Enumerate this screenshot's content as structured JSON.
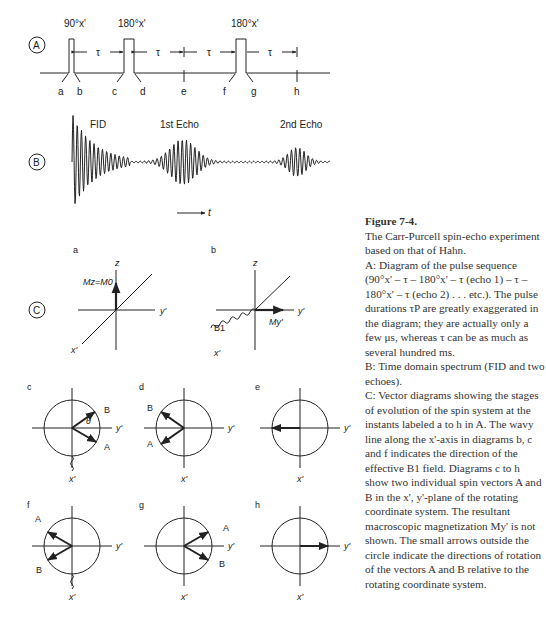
{
  "panel_labels": {
    "A": "A",
    "B": "B",
    "C": "C"
  },
  "pulse_sequence": {
    "pulses": [
      "90°x'",
      "180°x'",
      "180°x'"
    ],
    "tau_label": "τ",
    "instants": [
      "a",
      "b",
      "c",
      "d",
      "e",
      "f",
      "g",
      "h"
    ]
  },
  "signal": {
    "labels": [
      "FID",
      "1st Echo",
      "2nd Echo"
    ],
    "time_arrow_label": "t"
  },
  "vector_diagrams": {
    "a": {
      "label": "a",
      "z": "z",
      "y": "y'",
      "x": "x'",
      "vector": "Mz=M0"
    },
    "b": {
      "label": "b",
      "z": "z",
      "y": "y'",
      "x": "x'",
      "field": "B1",
      "vector": "My'"
    },
    "c": {
      "label": "c",
      "y": "y'",
      "x": "x'",
      "A": "A",
      "B": "B",
      "angle": "θ"
    },
    "d": {
      "label": "d",
      "y": "y'",
      "x": "x'",
      "A": "A",
      "B": "B"
    },
    "e": {
      "label": "e",
      "y": "y'",
      "x": "x'"
    },
    "f": {
      "label": "f",
      "y": "y'",
      "x": "x'",
      "A": "A",
      "B": "B"
    },
    "g": {
      "label": "g",
      "y": "y'",
      "x": "x'",
      "A": "A",
      "B": "B"
    },
    "h": {
      "label": "h",
      "y": "y'",
      "x": "x'"
    }
  },
  "caption": {
    "title": "Figure 7-4.",
    "body": [
      "The Carr-Purcell spin-echo experiment based on that of Hahn.",
      "A: Diagram of the pulse sequence (90°x' – τ – 180°x' – τ (echo 1) – τ – 180°x' – τ (echo 2) . . . etc.). The pulse durations τP are greatly exaggerated in the diagram; they are actually only a few μs, whereas τ can be as much as several hundred ms.",
      "B: Time domain spectrum (FID and two echoes).",
      "C: Vector diagrams showing the stages of evolution of the spin system at the instants labeled a to h in A. The wavy line along the x'-axis in diagrams b, c and f indicates the direction of the effective B1 field. Diagrams c to h show two individual spin vectors A and B in the x', y'-plane of the rotating coordinate system. The resultant macroscopic magnetization My' is not shown. The small arrows outside the circle indicate the directions of rotation of the vectors A and B relative to the rotating coordinate system."
    ]
  }
}
